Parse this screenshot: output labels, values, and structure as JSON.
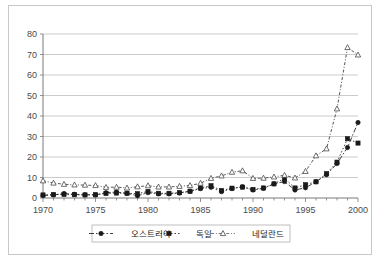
{
  "chart_data": {
    "type": "line",
    "title": "",
    "xlabel": "",
    "ylabel": "",
    "xlim": [
      1970,
      2000
    ],
    "ylim": [
      0,
      80
    ],
    "ytick_step": 10,
    "xtick_step": 5,
    "grid": true,
    "legend_position": "bottom",
    "yticks": [
      "0",
      "10",
      "20",
      "30",
      "40",
      "50",
      "60",
      "70",
      "80"
    ],
    "xticks": [
      "1970",
      "1975",
      "1980",
      "1985",
      "1990",
      "1995",
      "2000"
    ],
    "x": [
      1970,
      1971,
      1972,
      1973,
      1974,
      1975,
      1976,
      1977,
      1978,
      1979,
      1980,
      1981,
      1982,
      1983,
      1984,
      1985,
      1986,
      1987,
      1988,
      1989,
      1990,
      1991,
      1992,
      1993,
      1994,
      1995,
      1996,
      1997,
      1998,
      1999,
      2000
    ],
    "series": [
      {
        "name": "오스트리아",
        "marker": "circle",
        "dash": "dash-dot",
        "values": [
          1.2,
          1.5,
          2.2,
          1.8,
          1.6,
          1.5,
          2.6,
          2.9,
          2.3,
          1.1,
          2.6,
          2.0,
          2.0,
          2.4,
          3.3,
          4.6,
          5.2,
          3.1,
          4.6,
          5.5,
          3.9,
          4.7,
          6.9,
          8.0,
          3.9,
          5.0,
          7.9,
          11.3,
          16.8,
          24.6,
          36.8
        ]
      },
      {
        "name": "독일",
        "marker": "square",
        "dash": "dotted",
        "values": [
          1.5,
          1.7,
          1.7,
          1.6,
          1.5,
          1.6,
          2.2,
          2.4,
          2.3,
          2.1,
          3.2,
          2.3,
          2.3,
          2.6,
          3.3,
          4.9,
          6.0,
          3.7,
          4.8,
          5.3,
          4.2,
          4.9,
          6.9,
          9.5,
          4.9,
          6.5,
          7.9,
          11.9,
          17.5,
          28.9,
          26.8
        ]
      },
      {
        "name": "네덜란드",
        "marker": "triangle",
        "dash": "dash-dot-small",
        "values": [
          8.4,
          7.3,
          6.7,
          6.4,
          6.3,
          6.1,
          5.2,
          5.3,
          4.9,
          5.5,
          6.0,
          5.4,
          5.4,
          5.7,
          6.1,
          7.2,
          9.6,
          10.8,
          12.6,
          13.3,
          9.6,
          9.7,
          10.3,
          11.1,
          9.8,
          13.0,
          20.6,
          24.0,
          43.5,
          73.4,
          69.8
        ]
      }
    ]
  },
  "legend": {
    "entries": [
      {
        "label": "오스트리아"
      },
      {
        "label": "독일"
      },
      {
        "label": "네덜란드"
      }
    ]
  }
}
